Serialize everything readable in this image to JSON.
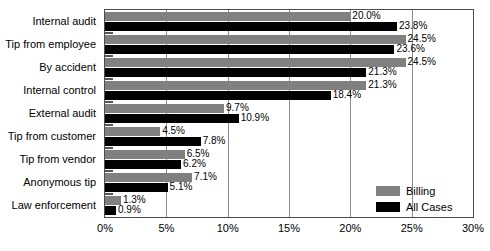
{
  "chart_data": {
    "type": "bar",
    "orientation": "horizontal",
    "title": "",
    "xlabel": "",
    "ylabel": "",
    "xlim": [
      0,
      30
    ],
    "xticks": [
      "0%",
      "5%",
      "10%",
      "15%",
      "20%",
      "25%",
      "30%"
    ],
    "xtick_values": [
      0,
      5,
      10,
      15,
      20,
      25,
      30
    ],
    "grid": true,
    "grid_axis": "x",
    "legend_position": "inside-bottom-right",
    "categories": [
      "Internal audit",
      "Tip from employee",
      "By accident",
      "Internal control",
      "External audit",
      "Tip from customer",
      "Tip from vendor",
      "Anonymous tip",
      "Law enforcement"
    ],
    "series": [
      {
        "name": "Billing",
        "color": "#808080",
        "values": [
          20.0,
          24.5,
          24.5,
          21.3,
          9.7,
          4.5,
          6.5,
          7.1,
          1.3
        ],
        "labels": [
          "20.0%",
          "24.5%",
          "24.5%",
          "21.3%",
          "9.7%",
          "4.5%",
          "6.5%",
          "7.1%",
          "1.3%"
        ]
      },
      {
        "name": "All Cases",
        "color": "#000000",
        "values": [
          23.8,
          23.6,
          21.3,
          18.4,
          10.9,
          7.8,
          6.2,
          5.1,
          0.9
        ],
        "labels": [
          "23.8%",
          "23.6%",
          "21.3%",
          "18.4%",
          "10.9%",
          "7.8%",
          "6.2%",
          "5.1%",
          "0.9%"
        ]
      }
    ]
  },
  "legend": {
    "items": [
      {
        "label": "Billing",
        "color": "#808080"
      },
      {
        "label": "All Cases",
        "color": "#000000"
      }
    ]
  }
}
